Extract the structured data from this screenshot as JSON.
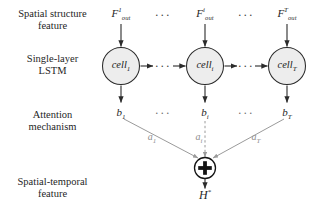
{
  "diagram": {
    "background_color": "#ffffff",
    "stroke_color": "#2b2b2b",
    "muted_color": "#8e8e8e",
    "node_fill": "#ededed",
    "stage_labels": [
      {
        "id": "spatial-structure-feature",
        "line1": "Spatial structure",
        "line2": "feature"
      },
      {
        "id": "single-layer-lstm",
        "line1": "Single-layer",
        "line2": "LSTM"
      },
      {
        "id": "attention-mechanism",
        "line1": "Attention",
        "line2": "mechanism"
      },
      {
        "id": "spatial-temporal-feature",
        "line1": "Spatial-temporal",
        "line2": "feature"
      }
    ],
    "input_features": [
      {
        "id": "f-out-1",
        "base": "F",
        "sup": "1",
        "sub": "out"
      },
      {
        "id": "f-out-i",
        "base": "F",
        "sup": "i",
        "sub": "out"
      },
      {
        "id": "f-out-T",
        "base": "F",
        "sup": "T",
        "sub": "out"
      }
    ],
    "cells": [
      {
        "id": "cell-1",
        "base": "cell",
        "sub": "1"
      },
      {
        "id": "cell-i",
        "base": "cell",
        "sub": "i"
      },
      {
        "id": "cell-T",
        "base": "cell",
        "sub": "T"
      }
    ],
    "hidden_states": [
      {
        "id": "b-1",
        "base": "b",
        "sub": "1"
      },
      {
        "id": "b-i",
        "base": "b",
        "sub": "i"
      },
      {
        "id": "b-T",
        "base": "b",
        "sub": "T"
      }
    ],
    "attention_weights": [
      {
        "id": "a-1",
        "base": "a",
        "sub": "1"
      },
      {
        "id": "a-i",
        "base": "a",
        "sub": "i"
      },
      {
        "id": "a-T",
        "base": "a",
        "sub": "T"
      }
    ],
    "sum_node": {
      "id": "sum-node",
      "symbol": "+"
    },
    "output": {
      "id": "h-star",
      "base": "H",
      "sup": "*"
    },
    "ellipses": {
      "top_left": "···",
      "top_right": "···",
      "cell_left": "···",
      "cell_right": "···",
      "hidden_left": "···",
      "hidden_right": "···"
    }
  }
}
